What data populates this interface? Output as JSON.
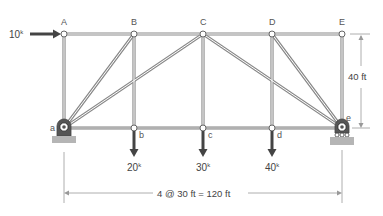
{
  "diagram": {
    "type": "truss",
    "top_joints": [
      {
        "id": "A",
        "label": "A",
        "x": 64,
        "y": 34
      },
      {
        "id": "B",
        "label": "B",
        "x": 134,
        "y": 34
      },
      {
        "id": "C",
        "label": "C",
        "x": 203,
        "y": 34
      },
      {
        "id": "D",
        "label": "D",
        "x": 272,
        "y": 34
      },
      {
        "id": "E",
        "label": "E",
        "x": 342,
        "y": 34
      }
    ],
    "bottom_joints": [
      {
        "id": "a",
        "label": "a",
        "x": 64,
        "y": 128
      },
      {
        "id": "b",
        "label": "b",
        "x": 134,
        "y": 128
      },
      {
        "id": "c",
        "label": "c",
        "x": 203,
        "y": 128
      },
      {
        "id": "d",
        "label": "d",
        "x": 272,
        "y": 128
      },
      {
        "id": "e",
        "label": "e",
        "x": 342,
        "y": 128
      }
    ],
    "members": [
      [
        "A",
        "B"
      ],
      [
        "B",
        "C"
      ],
      [
        "C",
        "D"
      ],
      [
        "D",
        "E"
      ],
      [
        "a",
        "b"
      ],
      [
        "b",
        "c"
      ],
      [
        "c",
        "d"
      ],
      [
        "d",
        "e"
      ],
      [
        "A",
        "a"
      ],
      [
        "B",
        "b"
      ],
      [
        "C",
        "c"
      ],
      [
        "D",
        "d"
      ],
      [
        "E",
        "e"
      ],
      [
        "a",
        "B"
      ],
      [
        "a",
        "C"
      ],
      [
        "C",
        "e"
      ],
      [
        "D",
        "e"
      ]
    ],
    "loads": {
      "horizontal": {
        "joint": "A",
        "value": "10",
        "unit": "k"
      },
      "vertical": [
        {
          "joint": "b",
          "value": "20",
          "unit": "k"
        },
        {
          "joint": "c",
          "value": "30",
          "unit": "k"
        },
        {
          "joint": "d",
          "value": "40",
          "unit": "k"
        }
      ]
    },
    "supports": {
      "left": {
        "joint": "a",
        "type": "pin"
      },
      "right": {
        "joint": "e",
        "type": "roller"
      }
    },
    "dimensions": {
      "height": "40 ft",
      "span": "4 @ 30 ft = 120 ft"
    },
    "colors": {
      "member": "#8a8a8a",
      "load_arrow": "#444444",
      "support": "#b5b5b5",
      "dimension_line": "#999999"
    }
  }
}
